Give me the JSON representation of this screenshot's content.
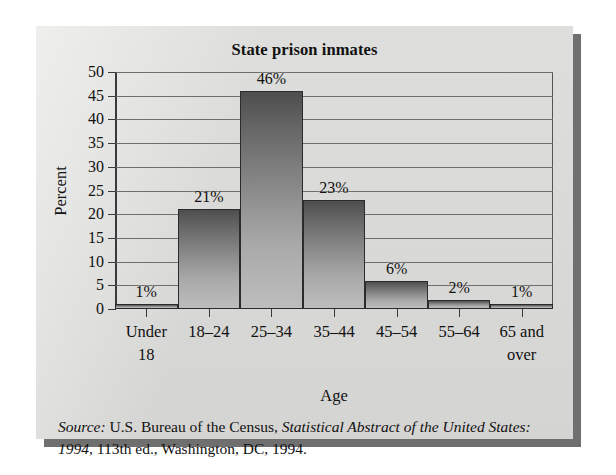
{
  "figure": {
    "title": "State prison inmates",
    "yaxis_title": "Percent",
    "xaxis_title": "Age",
    "source_prefix": "Source:",
    "source_line1_a": " U.S. Bureau of the Census, ",
    "source_line1_italic": "Statistical Abstract of the",
    "source_line2_italic": "United States: 1994",
    "source_line2_b": ", 113th ed., Washington, DC, 1994."
  },
  "colors": {
    "panel_background": "#dcdcda",
    "panel_shadow": "#6f6f6f",
    "bar_top": "#4e4e4e",
    "bar_bottom": "#bdbdbd",
    "bar_outline": "#2b2b2b",
    "gridline": "#6e6e6e",
    "axis": "#3a3a3a",
    "text": "#111111",
    "page_background": "#ffffff"
  },
  "chart_data": {
    "type": "bar",
    "title": "State prison inmates",
    "xlabel": "Age",
    "ylabel": "Percent",
    "ylim": [
      0,
      50
    ],
    "yticks": [
      0,
      5,
      10,
      15,
      20,
      25,
      30,
      35,
      40,
      45,
      50
    ],
    "ytick_labels": [
      "0",
      "5",
      "10",
      "15",
      "20",
      "25",
      "30",
      "35",
      "40",
      "45",
      "50"
    ],
    "grid": "horizontal",
    "legend": "none",
    "categories": [
      "Under 18",
      "18–24",
      "25–34",
      "35–44",
      "45–54",
      "55–64",
      "65 and over"
    ],
    "category_lines": [
      [
        "Under",
        "18"
      ],
      [
        "18–24",
        ""
      ],
      [
        "25–34",
        ""
      ],
      [
        "35–44",
        ""
      ],
      [
        "45–54",
        ""
      ],
      [
        "55–64",
        ""
      ],
      [
        "65 and",
        "over"
      ]
    ],
    "values": [
      1,
      21,
      46,
      23,
      6,
      2,
      1
    ],
    "data_labels": [
      "1%",
      "21%",
      "46%",
      "23%",
      "6%",
      "2%",
      "1%"
    ],
    "units": "percent"
  }
}
